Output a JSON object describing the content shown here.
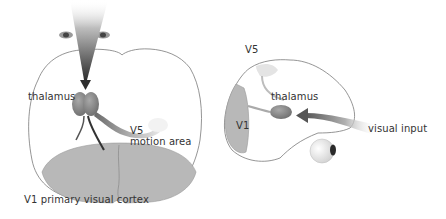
{
  "figure": {
    "left_panel": {
      "view": "top view of brain",
      "labels": {
        "thalamus": "thalamus",
        "v5": "V5",
        "motion_area": "motion area",
        "v1": "V1 primary visual cortex"
      }
    },
    "right_panel": {
      "view": "side view of brain",
      "labels": {
        "v5": "V5",
        "thalamus": "thalamus",
        "v1": "V1",
        "visual_input": "visual input"
      }
    }
  },
  "colors": {
    "outline": "#7a7a7a",
    "cortex_fill": "#b8b8b8",
    "thalamus_fill": "#8a8a8a",
    "arrow_dark": "#3a3a3a",
    "label_text": "#333333"
  }
}
